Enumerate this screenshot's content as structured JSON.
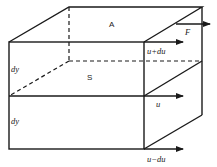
{
  "diagram": {
    "labels": {
      "top_area": "A",
      "force": "F",
      "velocity_top": "u+du",
      "velocity_mid": "u",
      "velocity_bottom": "u−du",
      "layer_upper_thickness": "dy",
      "layer_lower_thickness": "dy",
      "interface_surface": "S"
    },
    "colors": {
      "stroke": "#1a1a1a",
      "background": "#ffffff"
    }
  }
}
